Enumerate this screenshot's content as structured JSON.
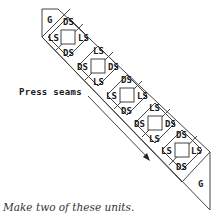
{
  "diagram": {
    "corner_top_label": "G",
    "corner_bottom_label": "G",
    "annotation": "Press seams",
    "caption": "Make two of these units.",
    "blocks": [
      {
        "top": "DS",
        "left": "LS",
        "right": "LS",
        "bottom": "DS"
      },
      {
        "top": "LS",
        "left": "DS",
        "right": "DS",
        "bottom": "LS"
      },
      {
        "top": "DS",
        "left": "LS",
        "right": "LS",
        "bottom": "DS"
      },
      {
        "top": "LS",
        "left": "DS",
        "right": "DS",
        "bottom": "LS"
      },
      {
        "top": "DS",
        "left": "LS",
        "right": "LS",
        "bottom": "DS"
      }
    ],
    "colors": {
      "line": "#444444",
      "text": "#1a1a1a",
      "background": "#ffffff"
    }
  }
}
